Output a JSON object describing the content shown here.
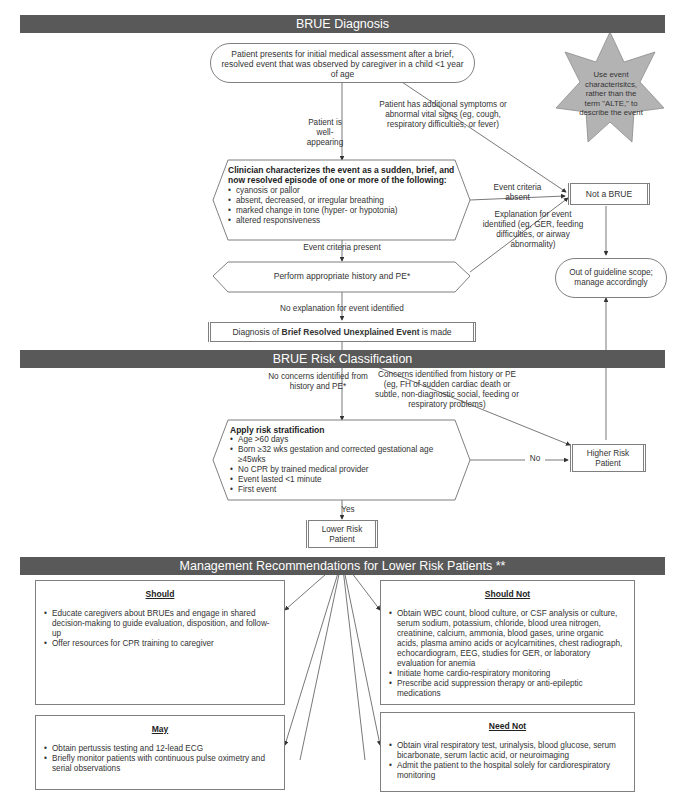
{
  "banners": {
    "diagnosis": "BRUE Diagnosis",
    "risk": "BRUE Risk Classification",
    "management": "Management Recommendations for Lower Risk Patients **"
  },
  "start_node": "Patient presents for initial medical assessment after a brief, resolved event that was observed by caregiver in a child <1 year of age",
  "star_note": "Use event characterisitcs, rather than the term \"ALTE,\" to describe the event",
  "labels": {
    "well_appearing": "Patient is well-appearing",
    "additional_symptoms": "Patient has additional symptoms or abnormal vital signs (eg, cough, respiratory difficulties, or fever)",
    "event_criteria_absent": "Event criteria absent",
    "explanation_identified": "Explanation for event identified (eg, GER, feeding difficulties, or airway abnormality)",
    "event_criteria_present": "Event criteria present",
    "no_explanation": "No explanation for event identified",
    "no_concerns": "No concerns identified from history and PE*",
    "concerns": "Concerns identified from history or PE (eg, FH of sudden cardiac death or subtle, non-diagnostic social, feeding or respiratory problems)",
    "no": "No",
    "yes": "Yes"
  },
  "characterize": {
    "title": "Clinician characterizes the event as a sudden, brief, and now resolved episode of one or more of the following:",
    "items": [
      "cyanosis or pallor",
      "absent, decreased, or irregular breathing",
      "marked change in tone (hyper- or hypotonia)",
      "altered responsiveness"
    ]
  },
  "not_brue": "Not a BRUE",
  "out_of_scope": "Out of guideline scope; manage accordingly",
  "history_pe": "Perform appropriate history and PE*",
  "diagnosis": {
    "prefix": "Diagnosis of ",
    "bold": "Brief Resolved Unexplained Event",
    "suffix": " is made"
  },
  "risk_strat": {
    "title": "Apply risk stratification",
    "items": [
      "Age >60 days",
      "Born ≥32 wks gestation and corrected gestational age ≥45wks",
      "No CPR by trained medical provider",
      "Event lasted <1 minute",
      "First event"
    ]
  },
  "higher_risk": "Higher Risk Patient",
  "lower_risk": "Lower Risk Patient",
  "management": {
    "should": {
      "title": "Should",
      "items": [
        "Educate caregivers about BRUEs and engage in shared decision-making to guide evaluation, disposition, and follow-up",
        "Offer resources for CPR training to caregiver"
      ]
    },
    "should_not": {
      "title": "Should Not",
      "items": [
        "Obtain WBC count, blood culture, or CSF analysis or culture, serum sodium, potassium, chloride, blood urea nitrogen, creatinine, calcium, ammonia, blood gases, urine organic acids, plasma amino acids or acylcarnitines, chest radiograph, echocardiogram, EEG, studies for GER, or laboratory evaluation for anemia",
        "Initiate home cardio-respiratory monitoring",
        "Prescribe acid suppression therapy or anti-epileptic medications"
      ]
    },
    "may": {
      "title": "May",
      "items": [
        "Obtain pertussis testing and 12-lead ECG",
        "Briefly monitor patients with continuous pulse oximetry and serial observations"
      ]
    },
    "need_not": {
      "title": "Need Not",
      "items": [
        "Obtain viral respiratory test, urinalysis, blood glucose, serum bicarbonate, serum lactic acid, or neuroimaging",
        "Admit the patient to the hospital solely for cardiorespiratory monitoring"
      ]
    }
  },
  "colors": {
    "banner": "#595959",
    "star": "#b3b3b3",
    "border": "#7f7f7f"
  }
}
